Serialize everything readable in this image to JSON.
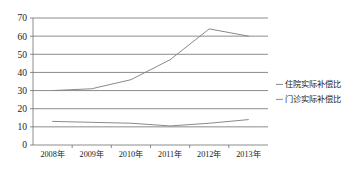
{
  "chart_data": {
    "type": "line",
    "title": "",
    "xlabel": "",
    "ylabel": "",
    "categories": [
      "2008年",
      "2009年",
      "2010年",
      "2011年",
      "2012年",
      "2013年"
    ],
    "ylim": [
      0,
      70
    ],
    "yticks": [
      0,
      10,
      20,
      30,
      40,
      50,
      60,
      70
    ],
    "ytick_labels": [
      "0",
      "10",
      "20",
      "30",
      "40",
      "50",
      "60",
      "70"
    ],
    "grid": true,
    "legend_position": "right",
    "series": [
      {
        "name": "住院实际补偿比",
        "color": "#8a8a8a",
        "values": [
          30,
          31,
          36,
          47,
          64,
          60
        ]
      },
      {
        "name": "门诊实际补偿比",
        "color": "#8a8a8a",
        "values": [
          13,
          12.5,
          12,
          10.5,
          12,
          14
        ]
      }
    ]
  },
  "legend": {
    "items": [
      {
        "label": "住院实际补偿比",
        "color": "#8a8a8a"
      },
      {
        "label": "门诊实际补偿比",
        "color": "#8a8a8a"
      }
    ]
  }
}
